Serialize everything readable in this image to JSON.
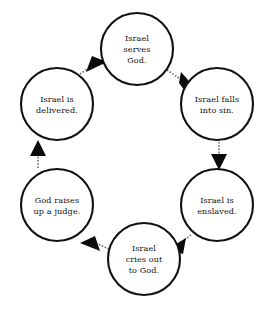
{
  "diagram": {
    "type": "cycle",
    "direction": "clockwise",
    "background_color": "#ffffff",
    "node_fill": "#ffffff",
    "node_stroke": "#111111",
    "connector_color": "#6d6d6d",
    "arrow_color": "#0a0a0a",
    "nodes": [
      {
        "id": "serves-god",
        "lines": [
          "Israel",
          "serves",
          "God."
        ],
        "cx": 137,
        "cy": 49,
        "r": 36
      },
      {
        "id": "falls-into-sin",
        "lines": [
          "Israel falls",
          "into sin."
        ],
        "cx": 217,
        "cy": 104,
        "r": 36
      },
      {
        "id": "enslaved",
        "lines": [
          "Israel is",
          "enslaved."
        ],
        "cx": 217,
        "cy": 205,
        "r": 36
      },
      {
        "id": "cries-out",
        "lines": [
          "Israel",
          "cries out",
          "to God."
        ],
        "cx": 144,
        "cy": 259,
        "r": 36
      },
      {
        "id": "raises-judge",
        "lines": [
          "God raises",
          "up a judge."
        ],
        "cx": 57,
        "cy": 205,
        "r": 36
      },
      {
        "id": "delivered",
        "lines": [
          "Israel is",
          "delivered."
        ],
        "cx": 57,
        "cy": 104,
        "r": 36
      }
    ],
    "edges": [
      {
        "id": "serves-to-sin",
        "from": "serves-god",
        "to": "falls-into-sin"
      },
      {
        "id": "sin-to-enslaved",
        "from": "falls-into-sin",
        "to": "enslaved"
      },
      {
        "id": "enslaved-to-cries",
        "from": "enslaved",
        "to": "cries-out"
      },
      {
        "id": "cries-to-judge",
        "from": "cries-out",
        "to": "raises-judge"
      },
      {
        "id": "judge-to-delivered",
        "from": "raises-judge",
        "to": "delivered"
      },
      {
        "id": "delivered-to-serves",
        "from": "delivered",
        "to": "serves-god"
      }
    ]
  }
}
